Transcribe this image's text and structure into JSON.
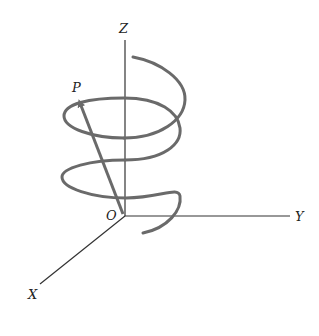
{
  "diagram": {
    "type": "3d-helix-coordinate-system",
    "axes": {
      "z_label": "Z",
      "y_label": "Y",
      "x_label": "X",
      "origin_label": "O"
    },
    "point_label": "P",
    "vector": "position vector from O to P on helix",
    "colors": {
      "helix": "#6a6a6a",
      "axis": "#333333",
      "background": "#ffffff"
    }
  }
}
